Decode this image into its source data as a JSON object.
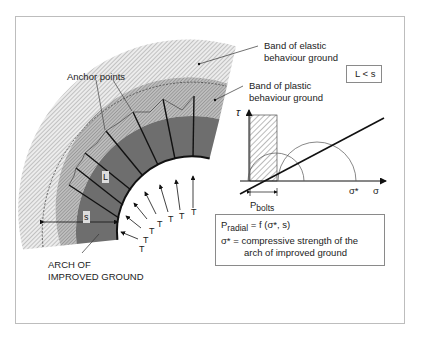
{
  "labels": {
    "anchor_points": "Anchor points",
    "elastic_band_line1": "Band of elastic",
    "elastic_band_line2": "behaviour ground",
    "plastic_band_line1": "Band of plastic",
    "plastic_band_line2": "behaviour ground",
    "arch_line1": "ARCH OF",
    "arch_line2": "IMPROVED GROUND",
    "L": "L",
    "s": "s",
    "T": "T"
  },
  "condition_box": {
    "text": "L < s"
  },
  "mohr_plot": {
    "y_axis_label": "τ",
    "x_axis_label": "σ",
    "sigma_star_label": "σ*",
    "p_bolts_main": "P",
    "p_bolts_sub": "bolts"
  },
  "formula_box": {
    "line1_main": "P",
    "line1_sub": "radial",
    "line1_rest": " = f  (σ*, s)",
    "line2": "σ* = compressive strength of the",
    "line3": "arch of improved ground"
  },
  "colors": {
    "improved_ground": "#6e6e6e",
    "plastic_band": "#a9a9a9",
    "elastic_band": "#d6d6d6",
    "line": "#111111",
    "frame": "#bdbdbd"
  }
}
